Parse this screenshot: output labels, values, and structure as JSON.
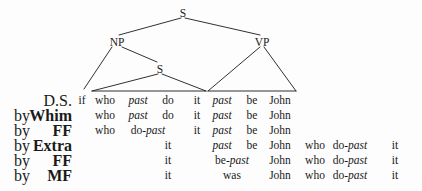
{
  "figure": {
    "background_color": "#fdfdfd",
    "ink_color": "#1a1a1a"
  },
  "tree": {
    "nodes": [
      {
        "id": "root-s",
        "label": "S",
        "x": 183,
        "y": 14
      },
      {
        "id": "np",
        "label": "NP",
        "x": 117,
        "y": 43
      },
      {
        "id": "vp",
        "label": "VP",
        "x": 262,
        "y": 43
      },
      {
        "id": "embedded-s",
        "label": "S",
        "x": 160,
        "y": 70
      }
    ]
  },
  "columns": {
    "if": 82,
    "who": 105,
    "past1": 138,
    "do": 168,
    "it1": 197,
    "past2": 222,
    "be": 252,
    "john": 280,
    "who2": 315,
    "dopast": 350,
    "it2": 395
  },
  "derivation": {
    "rows": [
      {
        "stage": "D.S.",
        "stage_is_rule": false,
        "by": "",
        "cells": [
          {
            "col": "if",
            "text": "if",
            "style": "roman"
          },
          {
            "col": "who",
            "text": "who",
            "style": "roman"
          },
          {
            "col": "past1",
            "text": "past",
            "style": "italic"
          },
          {
            "col": "do",
            "text": "do",
            "style": "roman"
          },
          {
            "col": "it1",
            "text": "it",
            "style": "roman"
          },
          {
            "col": "past2",
            "text": "past",
            "style": "italic"
          },
          {
            "col": "be",
            "text": "be",
            "style": "roman"
          },
          {
            "col": "john",
            "text": "John",
            "style": "roman"
          }
        ]
      },
      {
        "stage": "Whim",
        "stage_is_rule": true,
        "by": "by",
        "cells": [
          {
            "col": "who",
            "text": "who",
            "style": "roman"
          },
          {
            "col": "past1",
            "text": "past",
            "style": "italic"
          },
          {
            "col": "do",
            "text": "do",
            "style": "roman"
          },
          {
            "col": "it1",
            "text": "it",
            "style": "roman"
          },
          {
            "col": "past2",
            "text": "past",
            "style": "italic"
          },
          {
            "col": "be",
            "text": "be",
            "style": "roman"
          },
          {
            "col": "john",
            "text": "John",
            "style": "roman"
          }
        ]
      },
      {
        "stage": "FF",
        "stage_is_rule": true,
        "by": "by",
        "cells": [
          {
            "col": "who",
            "text": "who",
            "style": "roman"
          },
          {
            "col": "past1",
            "text": "do-past",
            "style": "roman-italic",
            "roman_part": "do-",
            "italic_part": "past",
            "offset": 10
          },
          {
            "col": "it1",
            "text": "it",
            "style": "roman"
          },
          {
            "col": "past2",
            "text": "past",
            "style": "italic"
          },
          {
            "col": "be",
            "text": "be",
            "style": "roman"
          },
          {
            "col": "john",
            "text": "John",
            "style": "roman"
          }
        ]
      },
      {
        "stage": "Extra",
        "stage_is_rule": true,
        "by": "by",
        "cells": [
          {
            "col": "do",
            "text": "it",
            "style": "roman"
          },
          {
            "col": "past2",
            "text": "past",
            "style": "italic"
          },
          {
            "col": "be",
            "text": "be",
            "style": "roman"
          },
          {
            "col": "john",
            "text": "John",
            "style": "roman"
          },
          {
            "col": "who2",
            "text": "who",
            "style": "roman"
          },
          {
            "col": "dopast",
            "text": "do-past",
            "style": "roman-italic",
            "roman_part": "do-",
            "italic_part": "past"
          },
          {
            "col": "it2",
            "text": "it",
            "style": "roman"
          }
        ]
      },
      {
        "stage": "FF",
        "stage_is_rule": true,
        "by": "by",
        "cells": [
          {
            "col": "do",
            "text": "it",
            "style": "roman"
          },
          {
            "col": "past2",
            "text": "be-past",
            "style": "roman-italic",
            "roman_part": "be-",
            "italic_part": "past",
            "offset": 10
          },
          {
            "col": "john",
            "text": "John",
            "style": "roman"
          },
          {
            "col": "who2",
            "text": "who",
            "style": "roman"
          },
          {
            "col": "dopast",
            "text": "do-past",
            "style": "roman-italic",
            "roman_part": "do-",
            "italic_part": "past"
          },
          {
            "col": "it2",
            "text": "it",
            "style": "roman"
          }
        ]
      },
      {
        "stage": "MF",
        "stage_is_rule": true,
        "by": "by",
        "cells": [
          {
            "col": "do",
            "text": "it",
            "style": "roman"
          },
          {
            "col": "past2",
            "text": "was",
            "style": "roman",
            "offset": 10
          },
          {
            "col": "john",
            "text": "John",
            "style": "roman"
          },
          {
            "col": "who2",
            "text": "who",
            "style": "roman"
          },
          {
            "col": "dopast",
            "text": "do-past",
            "style": "roman-italic",
            "roman_part": "do-",
            "italic_part": "past"
          },
          {
            "col": "it2",
            "text": "it",
            "style": "roman"
          }
        ]
      }
    ]
  }
}
